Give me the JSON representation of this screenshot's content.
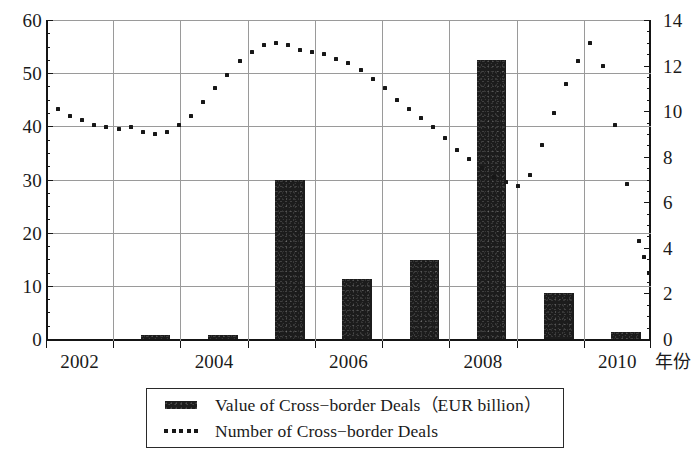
{
  "chart_data": {
    "type": "bar",
    "title": "",
    "subtitle": "",
    "xlabel": "年份",
    "ylabel": "",
    "y2label": "",
    "grid": true,
    "legend_position": "bottom",
    "categories": [
      "2002",
      "2003",
      "2004",
      "2005",
      "2006",
      "2007",
      "2008",
      "2009",
      "2010"
    ],
    "xtick_labels": [
      "2002",
      "",
      "2004",
      "",
      "2006",
      "",
      "2008",
      "",
      "2010"
    ],
    "ylim": [
      0,
      60
    ],
    "yticks": [
      0,
      10,
      20,
      30,
      40,
      50,
      60
    ],
    "y2lim": [
      0,
      14
    ],
    "y2ticks": [
      0,
      2,
      4,
      6,
      8,
      10,
      12,
      14
    ],
    "series": [
      {
        "name": "Value of Cross-border Deals（EUR billion）",
        "type": "bar",
        "axis": "left",
        "color": "#1c1c1c",
        "values": [
          0,
          0.7,
          0.7,
          30.0,
          11.2,
          14.8,
          52.5,
          8.7,
          1.3
        ]
      },
      {
        "name": "Number of Cross-border Deals",
        "type": "line",
        "style": "dotted",
        "axis": "right",
        "color": "#171717",
        "x": [
          2002.12,
          2002.3,
          2002.48,
          2002.66,
          2002.84,
          2003.02,
          2003.2,
          2003.38,
          2003.56,
          2003.74,
          2003.92,
          2004.1,
          2004.28,
          2004.46,
          2004.64,
          2004.82,
          2005.0,
          2005.18,
          2005.36,
          2005.54,
          2005.72,
          2005.9,
          2006.08,
          2006.26,
          2006.44,
          2006.62,
          2006.8,
          2006.98,
          2007.16,
          2007.34,
          2007.52,
          2007.7,
          2007.88,
          2008.06,
          2008.24,
          2008.42,
          2008.6,
          2008.78,
          2008.96,
          2009.14,
          2009.32,
          2009.5,
          2009.68,
          2009.86,
          2010.04,
          2010.22,
          2010.4,
          2010.58,
          2010.76
        ],
        "values": [
          10.1,
          9.8,
          9.6,
          9.4,
          9.3,
          9.2,
          9.3,
          9.1,
          9.0,
          9.1,
          9.4,
          9.8,
          10.4,
          11.0,
          11.6,
          12.2,
          12.6,
          12.9,
          13.0,
          12.9,
          12.7,
          12.6,
          12.5,
          12.3,
          12.1,
          11.8,
          11.4,
          11.0,
          10.5,
          10.1,
          9.7,
          9.3,
          8.8,
          8.3,
          7.9,
          7.5,
          7.1,
          6.9,
          6.7,
          7.2,
          8.5,
          9.9,
          11.2,
          12.2,
          13.0,
          12.0,
          9.4,
          6.8,
          4.3
        ],
        "note": "quarterly/monthly dotted markers; final point approx 2.2"
      }
    ],
    "annotations": []
  },
  "legend": {
    "entries": [
      {
        "key": "bar-swatch",
        "label": "Value of Cross−border Deals（EUR billion）"
      },
      {
        "key": "dotted-swatch",
        "label": "Number of Cross−border Deals"
      }
    ]
  },
  "axes": {
    "left_tick_labels": [
      "60",
      "50",
      "40",
      "30",
      "20",
      "10",
      "0"
    ],
    "right_tick_labels": [
      "14",
      "12",
      "10",
      "8",
      "6",
      "4",
      "2",
      "0"
    ],
    "x_tick_labels": [
      "2002",
      "2004",
      "2006",
      "2008",
      "2010"
    ],
    "x_title": "年份"
  }
}
